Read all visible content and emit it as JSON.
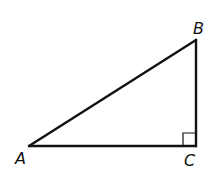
{
  "diagram": {
    "type": "right-triangle",
    "stroke_color": "#111111",
    "background": "#ffffff",
    "vertices": {
      "A": {
        "label": "A",
        "x": 29,
        "y": 146
      },
      "B": {
        "label": "B",
        "x": 196,
        "y": 40
      },
      "C": {
        "label": "C",
        "x": 196,
        "y": 146
      }
    },
    "right_angle_at": "C",
    "segments": [
      "AB",
      "BC",
      "CA"
    ]
  }
}
